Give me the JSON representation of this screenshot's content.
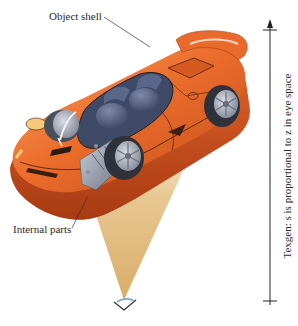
{
  "figure": {
    "labels": {
      "object_shell": "Object shell",
      "internal_parts": "Internal parts",
      "axis": "Texgen: s is proportional to z in eye space"
    },
    "colors": {
      "car_body": "#e8692a",
      "car_body_dark": "#b9441a",
      "car_body_light": "#f59a5c",
      "interior": "#4d5a78",
      "tire": "#3a3d48",
      "rim": "#9aa0ad",
      "view_cone": "#e4c38c",
      "axis_line": "#222222",
      "eye": "#2f2f2f",
      "eye_lens": "#7fa8c8"
    },
    "axis": {
      "direction": "up",
      "ticks": 2
    }
  }
}
